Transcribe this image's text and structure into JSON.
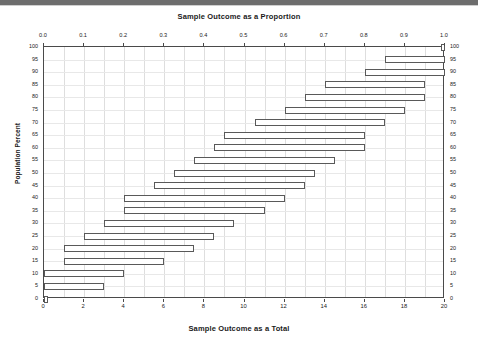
{
  "chart_data": {
    "type": "bar",
    "title": "Sample Outcome as a Proportion",
    "xlabel": "Sample Outcome as a Total",
    "xlabel_top": "Sample Outcome as a Proportion",
    "ylabel": "Population Percent",
    "grid": true,
    "legend": "none",
    "xlim_total": [
      0,
      20
    ],
    "xlim_proportion": [
      0.0,
      1.0
    ],
    "ylim": [
      0,
      100
    ],
    "xticks_top": [
      "0.0",
      "0.1",
      "0.2",
      "0.3",
      "0.4",
      "0.5",
      "0.6",
      "0.7",
      "0.8",
      "0.9",
      "1.0"
    ],
    "xticks_top_values": [
      0.0,
      0.1,
      0.2,
      0.3,
      0.4,
      0.5,
      0.6,
      0.7,
      0.8,
      0.9,
      1.0
    ],
    "xticks_bottom": [
      "0",
      "2",
      "4",
      "6",
      "8",
      "10",
      "12",
      "14",
      "16",
      "18",
      "20"
    ],
    "xticks_bottom_values": [
      0,
      2,
      4,
      6,
      8,
      10,
      12,
      14,
      16,
      18,
      20
    ],
    "yticks": [
      "0",
      "5",
      "10",
      "15",
      "20",
      "25",
      "30",
      "35",
      "40",
      "45",
      "50",
      "55",
      "60",
      "65",
      "70",
      "75",
      "80",
      "85",
      "90",
      "95",
      "100"
    ],
    "yticks_values": [
      0,
      5,
      10,
      15,
      20,
      25,
      30,
      35,
      40,
      45,
      50,
      55,
      60,
      65,
      70,
      75,
      80,
      85,
      90,
      95,
      100
    ],
    "orientation": "horizontal",
    "categories": [
      0,
      5,
      10,
      15,
      20,
      25,
      30,
      35,
      40,
      45,
      50,
      55,
      60,
      65,
      70,
      75,
      80,
      85,
      90,
      95,
      100
    ],
    "intervals": [
      {
        "population_percent": 0,
        "low": 0.0,
        "high": 0.2
      },
      {
        "population_percent": 5,
        "low": 0.0,
        "high": 3.0
      },
      {
        "population_percent": 10,
        "low": 0.0,
        "high": 4.0
      },
      {
        "population_percent": 15,
        "low": 1.0,
        "high": 6.0
      },
      {
        "population_percent": 20,
        "low": 1.0,
        "high": 7.5
      },
      {
        "population_percent": 25,
        "low": 2.0,
        "high": 8.5
      },
      {
        "population_percent": 30,
        "low": 3.0,
        "high": 9.5
      },
      {
        "population_percent": 35,
        "low": 4.0,
        "high": 11.0
      },
      {
        "population_percent": 40,
        "low": 4.0,
        "high": 12.0
      },
      {
        "population_percent": 45,
        "low": 5.5,
        "high": 13.0
      },
      {
        "population_percent": 50,
        "low": 6.5,
        "high": 13.5
      },
      {
        "population_percent": 55,
        "low": 7.5,
        "high": 14.5
      },
      {
        "population_percent": 60,
        "low": 8.5,
        "high": 16.0
      },
      {
        "population_percent": 65,
        "low": 9.0,
        "high": 16.0
      },
      {
        "population_percent": 70,
        "low": 10.5,
        "high": 17.0
      },
      {
        "population_percent": 75,
        "low": 12.0,
        "high": 18.0
      },
      {
        "population_percent": 80,
        "low": 13.0,
        "high": 19.0
      },
      {
        "population_percent": 85,
        "low": 14.0,
        "high": 19.0
      },
      {
        "population_percent": 90,
        "low": 16.0,
        "high": 20.0
      },
      {
        "population_percent": 95,
        "low": 17.0,
        "high": 20.0
      },
      {
        "population_percent": 100,
        "low": 19.8,
        "high": 20.0
      }
    ]
  },
  "colors": {
    "bar_stroke": "#595959",
    "bar_fill": "#ffffff",
    "axis": "#4a4a4a",
    "grid": "#dedede",
    "text": "#1a1a1a",
    "topbar": "#6d6d6d"
  }
}
